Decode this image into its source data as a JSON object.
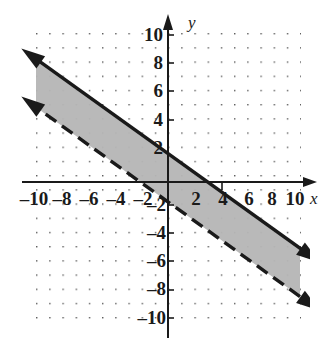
{
  "chart_data": {
    "type": "line",
    "title": "",
    "xlabel": "x",
    "ylabel": "y",
    "xlim": [
      -10,
      10
    ],
    "ylim": [
      -10,
      10
    ],
    "grid": true,
    "grid_style": "dotted",
    "tick_step": 2,
    "x_ticks": [
      -10,
      -8,
      -6,
      -4,
      -2,
      2,
      4,
      6,
      8,
      10
    ],
    "y_ticks": [
      10,
      8,
      6,
      4,
      2,
      -2,
      -4,
      -6,
      -8,
      -10
    ],
    "x_tick_labels": [
      "–10",
      "–8",
      "–6",
      "–4",
      "–2",
      "2",
      "4",
      "6",
      "8",
      "10"
    ],
    "y_tick_labels": [
      "10",
      "8",
      "6",
      "4",
      "2",
      "–2",
      "–4",
      "–6",
      "–8",
      "–10"
    ],
    "legend": [],
    "series": [
      {
        "name": "boundary-solid",
        "style": "solid",
        "slope": -0.6667,
        "intercept": 2,
        "arrows": "both",
        "x": [
          -10,
          10
        ],
        "values": [
          8.67,
          -4.67
        ]
      },
      {
        "name": "boundary-dashed",
        "style": "dashed",
        "slope": -0.6667,
        "intercept": -1.4,
        "arrows": "both",
        "x": [
          -10,
          10
        ],
        "values": [
          5.27,
          -8.07
        ]
      }
    ],
    "shaded_region": {
      "name": "solution-band",
      "between": [
        "boundary-dashed",
        "boundary-solid"
      ],
      "fill": "#b5b5b5"
    },
    "annotations": []
  },
  "colors": {
    "grid_dot": "#555555",
    "axis": "#1a1a1a",
    "line": "#1a1a1a",
    "shade": "#b8b8b8",
    "background": "#ffffff"
  },
  "labels": {
    "x_axis": "x",
    "y_axis": "y"
  }
}
